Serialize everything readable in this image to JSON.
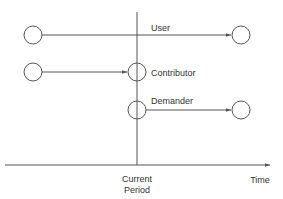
{
  "diagram": {
    "vertical_marker_label_line1": "Current",
    "vertical_marker_label_line2": "Period",
    "axis_label": "Time",
    "rows": [
      {
        "label": "User",
        "description": "Node before current period connected by arrow to node after current period"
      },
      {
        "label": "Contributor",
        "description": "Node before current period connected by arrow to node at current period"
      },
      {
        "label": "Demander",
        "description": "Node at current period connected by arrow to node after current period"
      }
    ],
    "colors": {
      "line": "#555555",
      "text": "#333333",
      "background": "#ffffff"
    }
  }
}
